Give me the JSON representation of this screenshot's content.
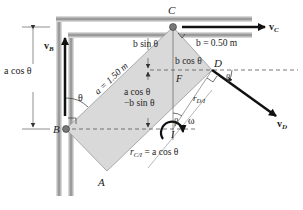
{
  "figure": {
    "points": {
      "A": "A",
      "B": "B",
      "C": "C",
      "D": "D",
      "F": "F",
      "I": "I"
    },
    "velocities": {
      "vB": "v",
      "vB_sub": "B",
      "vC": "v",
      "vC_sub": "C",
      "vD": "v",
      "vD_sub": "D"
    },
    "dimensions": {
      "a_label": "a = 1.50 m",
      "b_label": "b = 0.50 m",
      "b_sin": "b sin θ",
      "b_cos": "b cos θ",
      "a_cos_minus_line1": "a cos θ",
      "a_cos_minus_line2": "−b sin θ",
      "left_a_cos": "a cos θ",
      "r_CI": "r",
      "r_CI_sub": "C/I",
      "r_CI_eq": " = a cos θ",
      "r_DI": "r",
      "r_DI_sub": "D/I"
    },
    "angles": {
      "theta_B": "θ",
      "beta_D": "β",
      "beta_I": "β",
      "omega": "ω"
    },
    "colors": {
      "plate": "#d9d9d9",
      "wall": "#9a9a9a",
      "ink": "#111111",
      "dashed": "#555555"
    }
  }
}
